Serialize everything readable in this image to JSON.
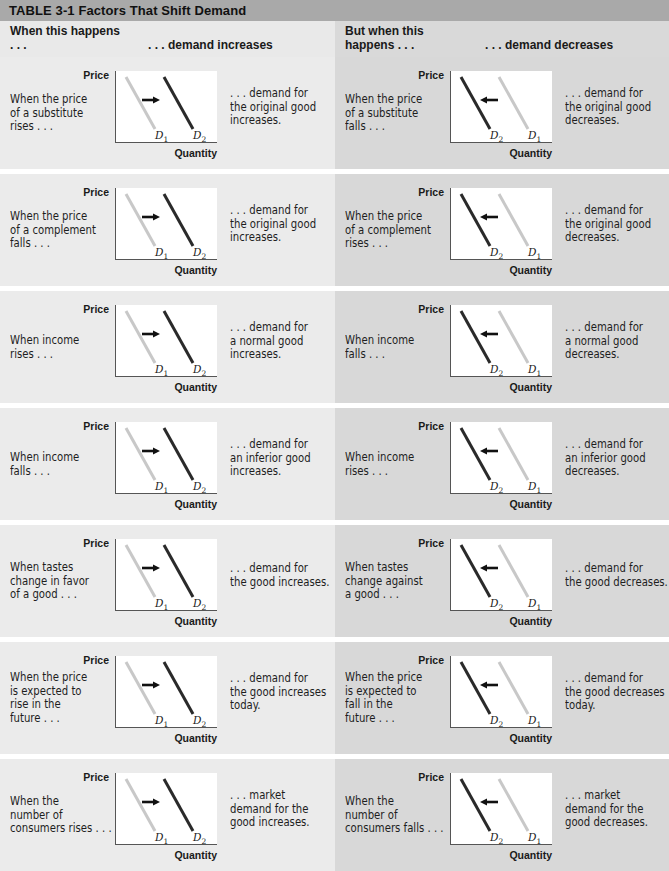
{
  "table": {
    "title": "TABLE 3-1  Factors That Shift Demand",
    "header_left": {
      "when": "When this happens . . .",
      "result": ". . . demand increases"
    },
    "header_right": {
      "when": "But when this happens . . .",
      "result": ". . . demand decreases"
    },
    "axis": {
      "y_label": "Price",
      "x_label": "Quantity",
      "curve_1": "D",
      "curve_1_sub": "1",
      "curve_2": "D",
      "curve_2_sub": "2"
    },
    "colors": {
      "title_bar": "#a9a9a9",
      "left_bg": "#ebebeb",
      "right_bg": "#d8d8d8",
      "original_curve": "#c8c8c8",
      "shifted_curve": "#2a2a2a"
    },
    "rows": [
      {
        "left": {
          "cause": "When the price\nof a substitute\nrises . . .",
          "effect": ". . . demand for\nthe original good\nincreases.",
          "shift": "right"
        },
        "right": {
          "cause": "When the price\nof a substitute\nfalls . . .",
          "effect": ". . . demand for\nthe original good\ndecreases.",
          "shift": "left"
        }
      },
      {
        "left": {
          "cause": "When the price\nof a complement\nfalls . . .",
          "effect": ". . . demand for\nthe original good\nincreases.",
          "shift": "right"
        },
        "right": {
          "cause": "When the price\nof a complement\nrises . . .",
          "effect": ". . . demand for\nthe original good\ndecreases.",
          "shift": "left"
        }
      },
      {
        "left": {
          "cause": "When income\nrises . . .",
          "effect": ". . . demand for\na normal good\nincreases.",
          "shift": "right"
        },
        "right": {
          "cause": "When income\nfalls . . .",
          "effect": ". . . demand for\na normal good\ndecreases.",
          "shift": "left"
        }
      },
      {
        "left": {
          "cause": "When income\nfalls . . .",
          "effect": ". . . demand for\nan inferior good\nincreases.",
          "shift": "right"
        },
        "right": {
          "cause": "When income\nrises . . .",
          "effect": ". . . demand for\nan inferior good\ndecreases.",
          "shift": "left"
        }
      },
      {
        "left": {
          "cause": "When tastes\nchange in favor\nof a good . . .",
          "effect": ". . . demand for\nthe good increases.",
          "shift": "right"
        },
        "right": {
          "cause": "When tastes\nchange against\na good . . .",
          "effect": ". . . demand for\nthe good decreases.",
          "shift": "left"
        }
      },
      {
        "left": {
          "cause": "When the price\nis expected to\nrise in the\nfuture . . .",
          "effect": ". . . demand for\nthe good increases\ntoday.",
          "shift": "right"
        },
        "right": {
          "cause": "When the price\nis expected to\nfall in the\nfuture . . .",
          "effect": ". . . demand for\nthe good decreases\ntoday.",
          "shift": "left"
        }
      },
      {
        "left": {
          "cause": "When the\nnumber of\nconsumers rises . . .",
          "effect": ". . . market\ndemand for the\ngood increases.",
          "shift": "right"
        },
        "right": {
          "cause": "When the\nnumber of\nconsumers falls . . .",
          "effect": ". . . market\ndemand for the\ngood decreases.",
          "shift": "left"
        }
      }
    ]
  }
}
